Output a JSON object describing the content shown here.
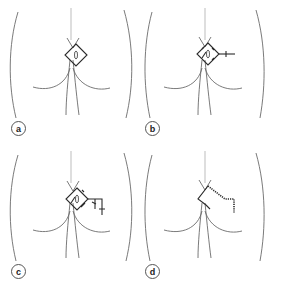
{
  "figure": {
    "panels": [
      {
        "id": "a",
        "label": "a",
        "description": "Rhomboid excision outlined over natal cleft with sinus marked"
      },
      {
        "id": "b",
        "label": "b",
        "description": "Flap design extended laterally from rhomboid"
      },
      {
        "id": "c",
        "label": "c",
        "description": "Flap incisions and transposition markings"
      },
      {
        "id": "d",
        "label": "d",
        "description": "Flap transposed and sutured"
      }
    ],
    "colors": {
      "outline": "#6b6b6b",
      "faint_line": "#b5b5b5",
      "incision": "#2a2a2a",
      "background": "#ffffff"
    }
  }
}
